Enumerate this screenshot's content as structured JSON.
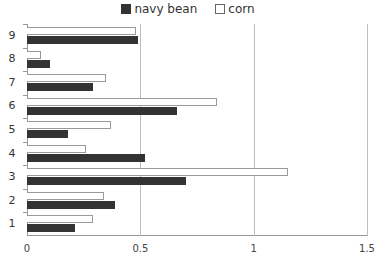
{
  "legend": {
    "items": [
      {
        "label": "navy bean",
        "color": "#333333"
      },
      {
        "label": "corn",
        "color": "#ffffff"
      }
    ]
  },
  "chart_data": {
    "type": "bar",
    "orientation": "horizontal",
    "title": "",
    "xlabel": "",
    "ylabel": "",
    "categories": [
      "1",
      "2",
      "3",
      "4",
      "5",
      "6",
      "7",
      "8",
      "9"
    ],
    "series": [
      {
        "name": "navy bean",
        "color": "#333333",
        "values": [
          0.21,
          0.39,
          0.7,
          0.52,
          0.18,
          0.66,
          0.29,
          0.1,
          0.49
        ]
      },
      {
        "name": "corn",
        "color": "#ffffff",
        "values": [
          0.29,
          0.34,
          1.15,
          0.26,
          0.37,
          0.84,
          0.35,
          0.06,
          0.48
        ]
      }
    ],
    "xlim": [
      0,
      1.5
    ],
    "xticks": [
      "0",
      "0.5",
      "1",
      "1.5"
    ],
    "grid": "vertical",
    "legend_position": "top"
  }
}
